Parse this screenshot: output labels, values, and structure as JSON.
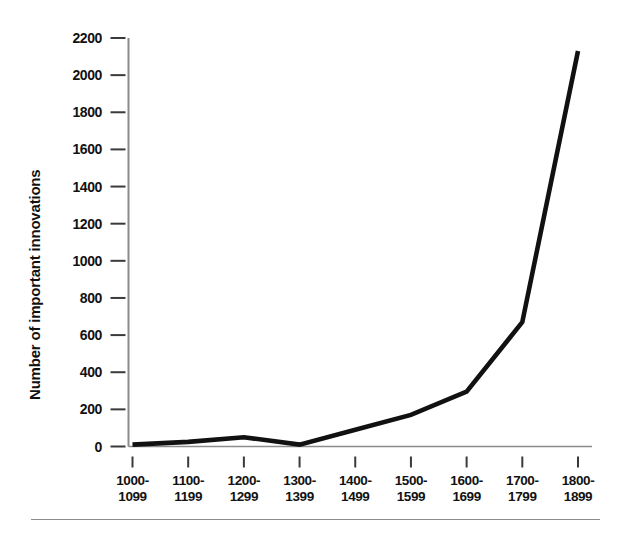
{
  "chart_data": {
    "type": "line",
    "title": "",
    "subtitle": "",
    "xlabel": "",
    "ylabel": "Number of important innovations",
    "categories": [
      "1000-1099",
      "1100-1199",
      "1200-1299",
      "1300-1399",
      "1400-1499",
      "1500-1599",
      "1600-1699",
      "1700-1799",
      "1800-1899"
    ],
    "category_lines": [
      [
        "1000-",
        "1099"
      ],
      [
        "1100-",
        "1199"
      ],
      [
        "1200-",
        "1299"
      ],
      [
        "1300-",
        "1399"
      ],
      [
        "1400-",
        "1499"
      ],
      [
        "1500-",
        "1599"
      ],
      [
        "1600-",
        "1699"
      ],
      [
        "1700-",
        "1799"
      ],
      [
        "1800-",
        "1899"
      ]
    ],
    "values": [
      10,
      25,
      50,
      10,
      90,
      170,
      295,
      670,
      2130
    ],
    "series": [
      {
        "name": "Number of important innovations",
        "values": [
          10,
          25,
          50,
          10,
          90,
          170,
          295,
          670,
          2130
        ]
      }
    ],
    "ylim": [
      0,
      2200
    ],
    "ytick_labels": [
      "2200",
      "2000",
      "1800",
      "1600",
      "1400",
      "1200",
      "1000",
      "800",
      "600",
      "400",
      "200",
      "0"
    ],
    "ytick_values": [
      2200,
      2000,
      1800,
      1600,
      1400,
      1200,
      1000,
      800,
      600,
      400,
      200,
      0
    ],
    "ytick_step": 200,
    "grid": false,
    "legend": false,
    "legend_position": "none",
    "line_color": "#111111",
    "axis_color": "#8c8c8c",
    "background_color": "#ffffff",
    "annotations": []
  },
  "figure": {
    "bottom_rule_color": "#8c8c8c"
  }
}
